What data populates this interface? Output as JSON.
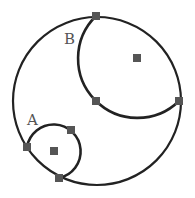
{
  "diagram": {
    "labels": {
      "a": "A",
      "b": "B"
    },
    "colors": {
      "stroke": "#222222",
      "node": "#555555",
      "label": "#555555",
      "background": "#ffffff"
    },
    "outer_circle": {
      "cx": 97,
      "cy": 101,
      "r": 84
    },
    "arc_a": {
      "cx": 54,
      "cy": 151,
      "r": 27,
      "center_node": [
        54,
        151
      ]
    },
    "arc_b": {
      "cx": 137,
      "cy": 58,
      "r": 59,
      "center_node": [
        137,
        58
      ]
    },
    "boundary_nodes": [
      [
        96,
        16
      ],
      [
        179,
        101
      ],
      [
        96,
        101
      ],
      [
        27,
        147
      ],
      [
        71,
        130
      ],
      [
        59,
        178
      ]
    ]
  }
}
